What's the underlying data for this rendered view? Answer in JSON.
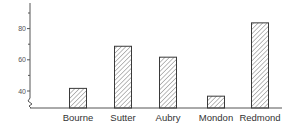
{
  "chart_data": {
    "type": "bar",
    "title": "",
    "xlabel": "",
    "ylabel": "",
    "categories": [
      "Bourne",
      "Sutter",
      "Aubry",
      "Mondon",
      "Redmond"
    ],
    "values": [
      42,
      69,
      62,
      37,
      84
    ],
    "ylim": [
      29,
      97
    ],
    "y_ticks_labeled": [
      40,
      60,
      80
    ],
    "y_ticks_minor": [
      50,
      70,
      90
    ],
    "axis_break": true,
    "grid": false,
    "legend": null,
    "bar_fill": "diagonal-hatch",
    "colors": {
      "bar_stroke": "#3a3a3a",
      "hatch": "#777777",
      "axis": "#555555"
    }
  },
  "axis": {
    "tick_labels": [
      "40",
      "60",
      "80"
    ]
  }
}
